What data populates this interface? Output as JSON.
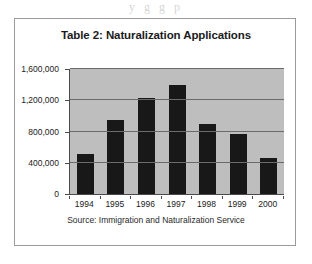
{
  "scan_artifact": {
    "text": "y                     g                           g  p"
  },
  "figure": {
    "title": "Table 2: Naturalization Applications",
    "source_note": "Source: Immigration and Naturalization Service",
    "colors": {
      "bar": "#181818",
      "plot_background": "#bebebe",
      "gridline": "#6b6b6b",
      "axis": "#4a4a4a",
      "border": "#9a9a9a",
      "page": "#ffffff"
    }
  },
  "chart_data": {
    "type": "bar",
    "title": "Table 2: Naturalization Applications",
    "subtitle": "",
    "xlabel": "",
    "ylabel": "",
    "categories": [
      "1994",
      "1995",
      "1996",
      "1997",
      "1998",
      "1999",
      "2000"
    ],
    "values": [
      510000,
      950000,
      1230000,
      1390000,
      900000,
      765000,
      455000
    ],
    "value_labels": [
      "510,000",
      "950,000",
      "1,230,000",
      "1,390,000",
      "900,000",
      "765,000",
      "455,000"
    ],
    "ylim": [
      0,
      1600000
    ],
    "yticks": [
      0,
      400000,
      800000,
      1200000,
      1600000
    ],
    "ytick_labels": [
      "0",
      "400,000",
      "800,000",
      "1,200,000",
      "1,600,000"
    ],
    "grid": true,
    "legend": false,
    "legend_position": "none",
    "series": [
      {
        "name": "Naturalization Applications",
        "values": [
          510000,
          950000,
          1230000,
          1390000,
          900000,
          765000,
          455000
        ]
      }
    ],
    "annotations": [
      "Source: Immigration and Naturalization Service"
    ]
  }
}
